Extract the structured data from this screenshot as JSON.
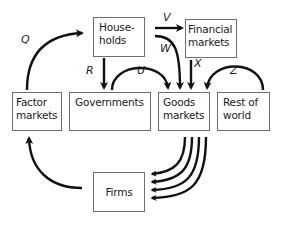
{
  "diagram": {
    "type": "circular-flow",
    "nodes": {
      "households": {
        "line1": "House-",
        "line2": "holds"
      },
      "financial_markets": {
        "line1": "Financial",
        "line2": "markets"
      },
      "factor_markets": {
        "line1": "Factor",
        "line2": "markets"
      },
      "governments": {
        "line1": "Governments"
      },
      "goods_markets": {
        "line1": "Goods",
        "line2": "markets"
      },
      "rest_of_world": {
        "line1": "Rest of",
        "line2": "world"
      },
      "firms": {
        "line1": "Firms"
      }
    },
    "flow_labels": {
      "q": "Q",
      "r": "R",
      "u": "U",
      "v": "V",
      "w": "W",
      "x": "X",
      "z": "Z"
    },
    "edges": [
      {
        "label": "Q",
        "from": "Factor markets",
        "to": "Households"
      },
      {
        "label": "R",
        "from": "Households",
        "to": "Governments"
      },
      {
        "label": "U",
        "from": "Governments",
        "to": "Goods markets"
      },
      {
        "label": "V",
        "from": "Households",
        "to": "Financial markets"
      },
      {
        "label": "W",
        "from": "Households",
        "to": "Goods markets"
      },
      {
        "label": "X",
        "from": "Financial markets",
        "to": "Goods markets"
      },
      {
        "label": "Z",
        "from": "Rest of world",
        "to": "Goods markets"
      },
      {
        "label": "",
        "from": "Goods markets",
        "to": "Firms",
        "count": 4
      },
      {
        "label": "",
        "from": "Firms",
        "to": "Factor markets"
      }
    ],
    "colors": {
      "line": "#111111",
      "border": "#6e6e6e",
      "background": "#ffffff"
    }
  }
}
